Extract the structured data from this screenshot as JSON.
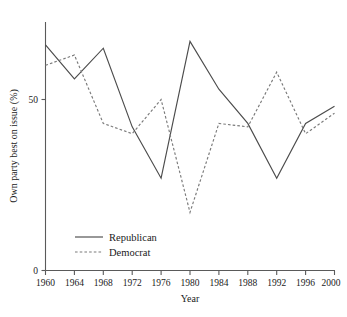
{
  "chart_data": {
    "type": "line",
    "title": "",
    "xlabel": "Year",
    "ylabel": "Own party best on issue (%)",
    "x": [
      1960,
      1964,
      1968,
      1972,
      1976,
      1980,
      1984,
      1988,
      1992,
      1996,
      2000
    ],
    "categories": [
      "1960",
      "1964",
      "1968",
      "1972",
      "1976",
      "1980",
      "1984",
      "1988",
      "1992",
      "1996",
      "2000"
    ],
    "xlim": [
      1960,
      2000
    ],
    "ylim": [
      0,
      70
    ],
    "yticks": [
      0,
      50
    ],
    "ytick_labels": [
      "0",
      "50"
    ],
    "grid": false,
    "legend_position": "inside-bottom-left",
    "series": [
      {
        "name": "Republican",
        "style": "solid",
        "color": "#4c4c4c",
        "values": [
          66,
          56,
          65,
          42,
          27,
          67,
          53,
          43,
          27,
          43,
          48
        ]
      },
      {
        "name": "Democrat",
        "style": "dotted",
        "color": "#7a7a7a",
        "values": [
          60,
          63,
          43,
          40,
          50,
          17,
          43,
          42,
          58,
          40,
          46
        ]
      }
    ]
  },
  "axes": {
    "y_title": "Own party best on issue (%)",
    "x_title": "Year",
    "y_tick_labels": [
      "50",
      "0"
    ],
    "x_tick_labels": [
      "1960",
      "1964",
      "1968",
      "1972",
      "1976",
      "1980",
      "1984",
      "1988",
      "1992",
      "1996",
      "2000"
    ]
  },
  "legend": {
    "items": [
      {
        "label": "Republican",
        "style": "solid"
      },
      {
        "label": "Democrat",
        "style": "dotted"
      }
    ]
  }
}
